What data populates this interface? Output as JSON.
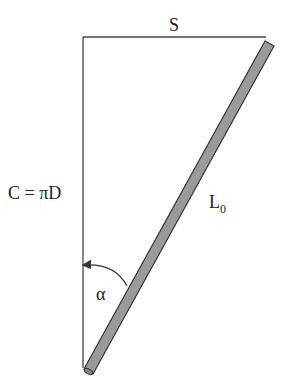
{
  "diagram": {
    "labels": {
      "top": "S",
      "left": "C = πD",
      "rod": "L",
      "rod_subscript": "0",
      "angle": "α"
    },
    "colors": {
      "line": "#333333",
      "rod_fill": "#9a9a9a",
      "rod_border": "#333333"
    }
  }
}
